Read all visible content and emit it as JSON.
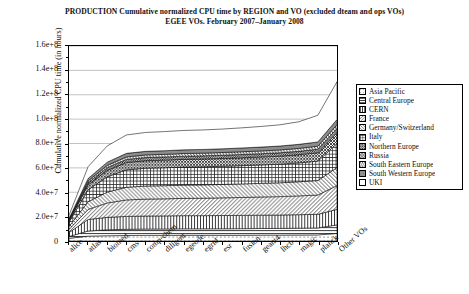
{
  "title": {
    "line1": "PRODUCTION Cumulative normalized CPU time by REGION and VO (excluded dteam and ops VOs)",
    "line2": "EGEE VOs. February 2007–January 2008"
  },
  "chart_data": {
    "type": "area",
    "title": "PRODUCTION Cumulative normalized CPU time by REGION and VO (excluded dteam and ops VOs)",
    "subtitle": "EGEE VOs. February 2007–January 2008",
    "xlabel": "",
    "ylabel": "Cumulative normalized CPU time (in hours)",
    "ylim": [
      0,
      160000000
    ],
    "yticks": [
      0,
      20000000,
      40000000,
      60000000,
      80000000,
      100000000,
      120000000,
      140000000,
      160000000
    ],
    "ytick_labels": [
      "0",
      "2.0e+7",
      "4.0e+7",
      "6.0e+7",
      "8.0e+7",
      "1.0e+8",
      "1.2e+8",
      "1.4e+8",
      "1.6e+8"
    ],
    "grid": true,
    "stacked": true,
    "legend_position": "right",
    "categories": [
      "alice",
      "atlas",
      "biomed",
      "cms",
      "comp-chem",
      "diligent",
      "egeode",
      "egrid",
      "esr",
      "fusion",
      "geant4",
      "lhcb",
      "magic",
      "planck",
      "Other VOs"
    ],
    "series": [
      {
        "name": "Asia Pacific",
        "pattern": "dots-sparse",
        "values": [
          2200000,
          4000000,
          4300000,
          4500000,
          4600000,
          4600000,
          4700000,
          4700000,
          4700000,
          4700000,
          4800000,
          4800000,
          4900000,
          5000000,
          6200000
        ]
      },
      {
        "name": "Central Europe",
        "pattern": "hlines",
        "values": [
          1500000,
          4200000,
          4900000,
          5100000,
          5200000,
          5250000,
          5300000,
          5300000,
          5350000,
          5400000,
          5450000,
          5500000,
          5600000,
          5700000,
          7000000
        ]
      },
      {
        "name": "CERN",
        "pattern": "vlines",
        "values": [
          3200000,
          9500000,
          10200000,
          10600000,
          10700000,
          10750000,
          10800000,
          10800000,
          10850000,
          10900000,
          10950000,
          11000000,
          11100000,
          11200000,
          12800000
        ]
      },
      {
        "name": "France",
        "pattern": "diag-right",
        "values": [
          2600000,
          8200000,
          11800000,
          13500000,
          13900000,
          14000000,
          14200000,
          14300000,
          14500000,
          14700000,
          14900000,
          15100000,
          15400000,
          15800000,
          19500000
        ]
      },
      {
        "name": "Germany/Switzerland",
        "pattern": "diag-left",
        "values": [
          2400000,
          6300000,
          8900000,
          10400000,
          10700000,
          10800000,
          10900000,
          10950000,
          11000000,
          11100000,
          11200000,
          11350000,
          11600000,
          11900000,
          14800000
        ]
      },
      {
        "name": "Italy",
        "pattern": "grid",
        "values": [
          3500000,
          9800000,
          12600000,
          14300000,
          14600000,
          14700000,
          14800000,
          14850000,
          14900000,
          15000000,
          15100000,
          15250000,
          15500000,
          15900000,
          19800000
        ]
      },
      {
        "name": "Northern Europe",
        "pattern": "crosshatch",
        "values": [
          1200000,
          4100000,
          5300000,
          6000000,
          6200000,
          6250000,
          6300000,
          6350000,
          6400000,
          6450000,
          6500000,
          6600000,
          6700000,
          6900000,
          8600000
        ]
      },
      {
        "name": "Russia",
        "pattern": "diag-dense",
        "values": [
          600000,
          1700000,
          2200000,
          2500000,
          2550000,
          2580000,
          2600000,
          2620000,
          2650000,
          2680000,
          2700000,
          2750000,
          2800000,
          2900000,
          3600000
        ]
      },
      {
        "name": "South Eastern Europe",
        "pattern": "diag-steep",
        "values": [
          500000,
          1500000,
          1900000,
          2100000,
          2150000,
          2180000,
          2200000,
          2220000,
          2250000,
          2280000,
          2300000,
          2350000,
          2400000,
          2500000,
          3100000
        ]
      },
      {
        "name": "South Western Europe",
        "pattern": "solid-gray",
        "values": [
          700000,
          2000000,
          2600000,
          2900000,
          2950000,
          2980000,
          3000000,
          3020000,
          3050000,
          3100000,
          3150000,
          3200000,
          3300000,
          3450000,
          4300000
        ]
      },
      {
        "name": "UKI",
        "pattern": "blank",
        "values": [
          2600000,
          9700000,
          13300000,
          15100000,
          15500000,
          15700000,
          15900000,
          16000000,
          16200000,
          16500000,
          16900000,
          17400000,
          18500000,
          21900000,
          31000000
        ]
      }
    ]
  },
  "yaxis": {
    "label": "Cumulative normalized CPU time (in hours)",
    "ticks": [
      "1.6e+8",
      "1.4e+8",
      "1.2e+8",
      "1.0e+8",
      "8.0e+7",
      "6.0e+7",
      "4.0e+7",
      "2.0e+7",
      "0"
    ]
  },
  "xaxis": {
    "labels": [
      "alice",
      "atlas",
      "biomed",
      "cms",
      "comp-chem",
      "diligent",
      "egeode",
      "egrid",
      "esr",
      "fusion",
      "geant4",
      "lhcb",
      "magic",
      "planck",
      "Other VOs"
    ]
  },
  "legend": {
    "items": [
      {
        "label": "Asia Pacific",
        "pattern": "dots-sparse"
      },
      {
        "label": "Central Europe",
        "pattern": "hlines"
      },
      {
        "label": "CERN",
        "pattern": "vlines"
      },
      {
        "label": "France",
        "pattern": "diag-right"
      },
      {
        "label": "Germany/Switzerland",
        "pattern": "diag-left"
      },
      {
        "label": "Italy",
        "pattern": "grid"
      },
      {
        "label": "Northern Europe",
        "pattern": "crosshatch"
      },
      {
        "label": "Russia",
        "pattern": "diag-dense"
      },
      {
        "label": "South Eastern Europe",
        "pattern": "diag-steep"
      },
      {
        "label": "South Western Europe",
        "pattern": "solid-gray"
      },
      {
        "label": "UKI",
        "pattern": "blank"
      }
    ]
  }
}
